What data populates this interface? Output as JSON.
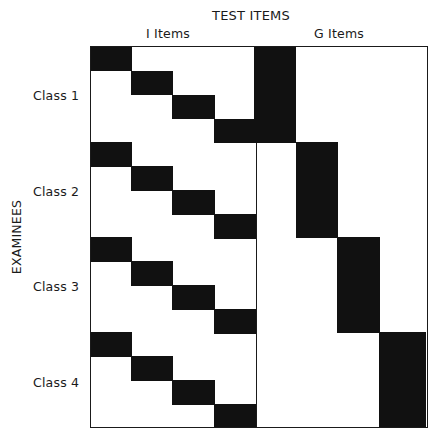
{
  "diagram": {
    "title": "TEST ITEMS",
    "column_groups": [
      {
        "label": "I Items",
        "items": 4
      },
      {
        "label": "G Items",
        "items": 4
      }
    ],
    "row_axis_label": "EXAMINEES",
    "classes": [
      {
        "label": "Class  1",
        "i_item_rows": 4,
        "g_item_column": 1
      },
      {
        "label": "Class  2",
        "i_item_rows": 4,
        "g_item_column": 2
      },
      {
        "label": "Class  3",
        "i_item_rows": 4,
        "g_item_column": 3
      },
      {
        "label": "Class  4",
        "i_item_rows": 4,
        "g_item_column": 4
      }
    ],
    "pattern_description": "Within each class, the I items form a staircase diagonal (row k takes I item k); each class takes exactly one G item spanning all its rows, with G items assigned diagonally across classes.",
    "colors": {
      "filled": "#111111",
      "empty": "#ffffff",
      "border": "#1a1a1a"
    }
  }
}
